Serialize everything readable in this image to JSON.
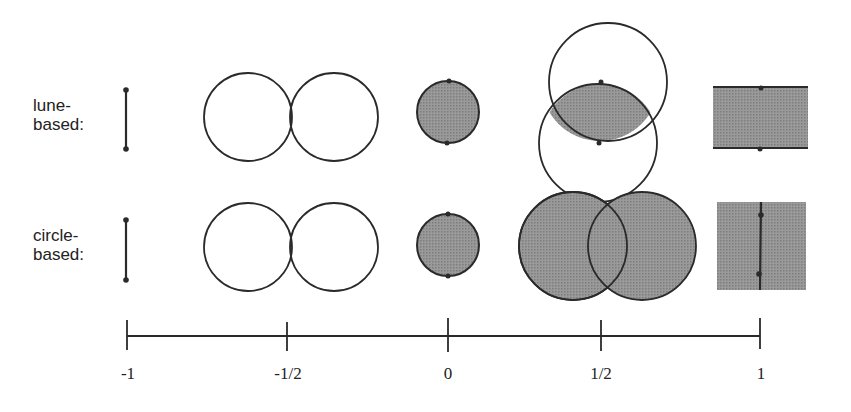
{
  "rows": [
    {
      "label": "lune-\nbased:"
    },
    {
      "label": "circle-\nbased:"
    }
  ],
  "axis": {
    "ticks": [
      "-1",
      "-1/2",
      "0",
      "1/2",
      "1"
    ]
  },
  "colors": {
    "stroke": "#2a2a2a",
    "fill": "#8c8c8c"
  }
}
